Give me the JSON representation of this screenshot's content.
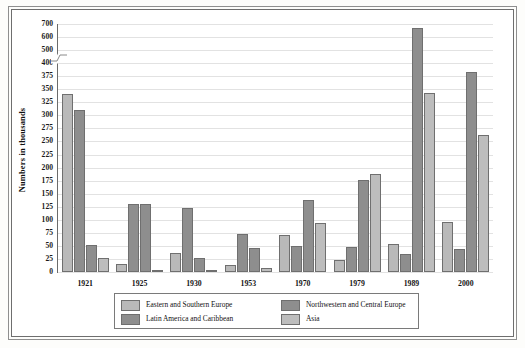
{
  "figure": {
    "y_axis_title": "Numbers in thousands"
  },
  "chart_data": {
    "type": "bar",
    "title": "",
    "xlabel": "",
    "ylabel": "Numbers in thousands",
    "grid": true,
    "legend_position": "bottom",
    "categories": [
      "1921",
      "1925",
      "1930",
      "1953",
      "1970",
      "1979",
      "1989",
      "2000"
    ],
    "ytick_labels": [
      "0",
      "25",
      "50",
      "75",
      "100",
      "125",
      "150",
      "175",
      "200",
      "225",
      "250",
      "275",
      "300",
      "325",
      "350",
      "375",
      "400",
      "500",
      "600",
      "700"
    ],
    "ylim": [
      0,
      700
    ],
    "axis_break": {
      "between": [
        400,
        500
      ],
      "note": "scale compresses above 400"
    },
    "series": [
      {
        "name": "Eastern and Southern Europe",
        "color": "#b9b9b9",
        "values": [
          340,
          16,
          37,
          13,
          70,
          23,
          53,
          95
        ]
      },
      {
        "name": "Northwestern and Central Europe",
        "color": "#8e8e8e",
        "values": [
          310,
          131,
          122,
          72,
          50,
          48,
          35,
          45
        ]
      },
      {
        "name": "Latin America and Caribbean",
        "color": "#8e8e8e",
        "values": [
          51,
          131,
          26,
          46,
          138,
          177,
          670,
          383
        ]
      },
      {
        "name": "Asia",
        "color": "#bdbdbd",
        "values": [
          26,
          3,
          4,
          8,
          94,
          188,
          343,
          262
        ]
      }
    ],
    "series_order_note": "within each year group bars are drawn left-to-right: Eastern and Southern Europe, Northwestern and Central Europe, Latin America and Caribbean, Asia",
    "data_by_year": [
      {
        "year": "1921",
        "eastern_southern_europe": 340,
        "northwestern_central_europe": 310,
        "latin_america_caribbean": 51,
        "asia": 26
      },
      {
        "year": "1925",
        "eastern_southern_europe": 16,
        "northwestern_central_europe": 131,
        "latin_america_caribbean": 45,
        "asia": 3
      },
      {
        "year": "1930",
        "eastern_southern_europe": 37,
        "northwestern_central_europe": 122,
        "latin_america_caribbean": 26,
        "asia": 4
      },
      {
        "year": "1953",
        "eastern_southern_europe": 13,
        "northwestern_central_europe": 72,
        "latin_america_caribbean": 46,
        "asia": 8
      },
      {
        "year": "1970",
        "eastern_southern_europe": 70,
        "northwestern_central_europe": 50,
        "latin_america_caribbean": 138,
        "asia": 94
      },
      {
        "year": "1979",
        "eastern_southern_europe": 23,
        "northwestern_central_europe": 48,
        "latin_america_caribbean": 177,
        "asia": 188
      },
      {
        "year": "1989",
        "eastern_southern_europe": 53,
        "northwestern_central_europe": 35,
        "latin_america_caribbean": 670,
        "asia": 343
      },
      {
        "year": "2000",
        "eastern_southern_europe": 95,
        "northwestern_central_europe": 45,
        "latin_america_caribbean": 383,
        "asia": 262
      }
    ]
  },
  "legend": {
    "entries": [
      {
        "label": "Eastern and Southern Europe",
        "color": "#b9b9b9"
      },
      {
        "label": "Northwestern and Central Europe",
        "color": "#8e8e8e"
      },
      {
        "label": "Latin America and Caribbean",
        "color": "#8e8e8e"
      },
      {
        "label": "Asia",
        "color": "#bdbdbd"
      }
    ]
  }
}
